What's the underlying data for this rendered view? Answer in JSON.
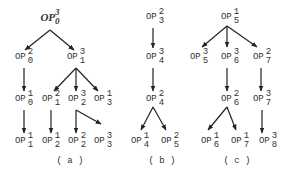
{
  "diagram": {
    "colors": {
      "line": "#222222",
      "text": "#333333",
      "background": "#ffffff"
    },
    "trees": [
      {
        "id": "a",
        "caption": "( a )",
        "caption_pos": [
          70,
          161
        ],
        "nodes": [
          {
            "id": "a_root",
            "base": "OP",
            "sup": "3",
            "sub": "0",
            "x": 50,
            "y": 17,
            "root": true
          },
          {
            "id": "a_20",
            "base": "OP",
            "sup": "2",
            "sub": "0",
            "x": 24,
            "y": 57
          },
          {
            "id": "a_31",
            "base": "OP",
            "sup": "3",
            "sub": "1",
            "x": 76,
            "y": 57
          },
          {
            "id": "a_10",
            "base": "OP",
            "sup": "1",
            "sub": "0",
            "x": 24,
            "y": 99
          },
          {
            "id": "a_21",
            "base": "OP",
            "sup": "2",
            "sub": "1",
            "x": 51,
            "y": 99
          },
          {
            "id": "a_32",
            "base": "OP",
            "sup": "3",
            "sub": "2",
            "x": 77,
            "y": 99
          },
          {
            "id": "a_13",
            "base": "OP",
            "sup": "1",
            "sub": "3",
            "x": 103,
            "y": 99
          },
          {
            "id": "a_11",
            "base": "OP",
            "sup": "1",
            "sub": "1",
            "x": 24,
            "y": 141
          },
          {
            "id": "a_12",
            "base": "OP",
            "sup": "1",
            "sub": "2",
            "x": 51,
            "y": 141
          },
          {
            "id": "a_22",
            "base": "OP",
            "sup": "2",
            "sub": "2",
            "x": 77,
            "y": 141
          },
          {
            "id": "a_33",
            "base": "OP",
            "sup": "3",
            "sub": "3",
            "x": 103,
            "y": 141
          }
        ],
        "edges": [
          {
            "x1": 50,
            "y1": 30,
            "x2": 25,
            "y2": 50
          },
          {
            "x1": 50,
            "y1": 30,
            "x2": 74,
            "y2": 50
          },
          {
            "x1": 24,
            "y1": 68,
            "x2": 24,
            "y2": 91
          },
          {
            "x1": 76,
            "y1": 68,
            "x2": 54,
            "y2": 91
          },
          {
            "x1": 76,
            "y1": 68,
            "x2": 76,
            "y2": 91
          },
          {
            "x1": 76,
            "y1": 68,
            "x2": 98,
            "y2": 91
          },
          {
            "x1": 24,
            "y1": 110,
            "x2": 24,
            "y2": 133
          },
          {
            "x1": 51,
            "y1": 110,
            "x2": 51,
            "y2": 133
          },
          {
            "x1": 76,
            "y1": 110,
            "x2": 76,
            "y2": 133
          },
          {
            "x1": 76,
            "y1": 110,
            "x2": 101,
            "y2": 124
          }
        ]
      },
      {
        "id": "b",
        "caption": "( b )",
        "caption_pos": [
          162,
          161
        ],
        "nodes": [
          {
            "id": "b_23",
            "base": "OP",
            "sup": "2",
            "sub": "3",
            "x": 155,
            "y": 17
          },
          {
            "id": "b_34",
            "base": "OP",
            "sup": "3",
            "sub": "4",
            "x": 155,
            "y": 57
          },
          {
            "id": "b_24",
            "base": "OP",
            "sup": "2",
            "sub": "4",
            "x": 155,
            "y": 99
          },
          {
            "id": "b_14",
            "base": "OP",
            "sup": "1",
            "sub": "4",
            "x": 140,
            "y": 141
          },
          {
            "id": "b_25",
            "base": "OP",
            "sup": "2",
            "sub": "5",
            "x": 170,
            "y": 141
          }
        ],
        "edges": [
          {
            "x1": 153,
            "y1": 28,
            "x2": 153,
            "y2": 48
          },
          {
            "x1": 153,
            "y1": 68,
            "x2": 153,
            "y2": 91
          },
          {
            "x1": 153,
            "y1": 107,
            "x2": 141,
            "y2": 130
          },
          {
            "x1": 153,
            "y1": 107,
            "x2": 166,
            "y2": 130
          }
        ]
      },
      {
        "id": "c",
        "caption": "( c )",
        "caption_pos": [
          237,
          161
        ],
        "nodes": [
          {
            "id": "c_15",
            "base": "OP",
            "sup": "1",
            "sub": "5",
            "x": 230,
            "y": 17
          },
          {
            "id": "c_35",
            "base": "OP",
            "sup": "3",
            "sub": "5",
            "x": 199,
            "y": 57
          },
          {
            "id": "c_36",
            "base": "OP",
            "sup": "3",
            "sub": "6",
            "x": 230,
            "y": 57
          },
          {
            "id": "c_27",
            "base": "OP",
            "sup": "2",
            "sub": "7",
            "x": 262,
            "y": 57
          },
          {
            "id": "c_26",
            "base": "OP",
            "sup": "2",
            "sub": "6",
            "x": 230,
            "y": 99
          },
          {
            "id": "c_37",
            "base": "OP",
            "sup": "3",
            "sub": "7",
            "x": 262,
            "y": 99
          },
          {
            "id": "c_16",
            "base": "OP",
            "sup": "1",
            "sub": "6",
            "x": 210,
            "y": 141
          },
          {
            "id": "c_17",
            "base": "OP",
            "sup": "1",
            "sub": "7",
            "x": 240,
            "y": 141
          },
          {
            "id": "c_38",
            "base": "OP",
            "sup": "3",
            "sub": "8",
            "x": 268,
            "y": 141
          }
        ],
        "edges": [
          {
            "x1": 227,
            "y1": 26,
            "x2": 202,
            "y2": 47
          },
          {
            "x1": 227,
            "y1": 26,
            "x2": 227,
            "y2": 47
          },
          {
            "x1": 227,
            "y1": 26,
            "x2": 257,
            "y2": 47
          },
          {
            "x1": 227,
            "y1": 68,
            "x2": 227,
            "y2": 91
          },
          {
            "x1": 261,
            "y1": 68,
            "x2": 261,
            "y2": 91
          },
          {
            "x1": 227,
            "y1": 107,
            "x2": 208,
            "y2": 130
          },
          {
            "x1": 227,
            "y1": 107,
            "x2": 236,
            "y2": 130
          },
          {
            "x1": 262,
            "y1": 110,
            "x2": 262,
            "y2": 133
          }
        ]
      }
    ]
  }
}
